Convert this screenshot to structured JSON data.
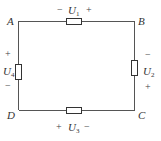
{
  "diagram": {
    "type": "circuit",
    "nodes": [
      {
        "id": "A",
        "label": "A"
      },
      {
        "id": "B",
        "label": "B"
      },
      {
        "id": "C",
        "label": "C"
      },
      {
        "id": "D",
        "label": "D"
      }
    ],
    "elements": [
      {
        "id": "U1",
        "symbol": "U",
        "sub": "1",
        "between": [
          "A",
          "B"
        ],
        "left_sign": "−",
        "right_sign": "+"
      },
      {
        "id": "U2",
        "symbol": "U",
        "sub": "2",
        "between": [
          "B",
          "C"
        ],
        "top_sign": "−",
        "bottom_sign": "+"
      },
      {
        "id": "U3",
        "symbol": "U",
        "sub": "3",
        "between": [
          "D",
          "C"
        ],
        "left_sign": "+",
        "right_sign": "−"
      },
      {
        "id": "U4",
        "symbol": "U",
        "sub": "4",
        "between": [
          "A",
          "D"
        ],
        "top_sign": "+",
        "bottom_sign": "−"
      }
    ],
    "colors": {
      "wire": "#555555",
      "text": "#333333"
    }
  }
}
